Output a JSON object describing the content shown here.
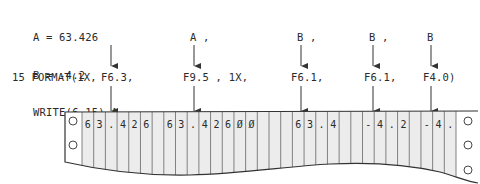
{
  "code": {
    "line1": "A = 63.426",
    "line2": "B = -4.2",
    "line3": "WRITE(6,15) A ,"
  },
  "variables": [
    {
      "label": "A ,",
      "x": 238
    },
    {
      "label": "A ,",
      "x": 299
    },
    {
      "label": "B ,",
      "x": 373
    },
    {
      "label": "B",
      "x": 430
    }
  ],
  "format": {
    "prefix": "15 FORMAT(1X,",
    "specs": [
      {
        "label": "F6.3,",
        "x": 101
      },
      {
        "label": "F9.5 , 1X,",
        "x": 183
      },
      {
        "label": "F6.1,",
        "x": 291
      },
      {
        "label": "F6.1,",
        "x": 364
      },
      {
        "label": "F4.0)",
        "x": 423
      }
    ]
  },
  "printout": {
    "cells": [
      "6",
      "3",
      ".",
      "4",
      "2",
      "6",
      " ",
      "6",
      "3",
      ".",
      "4",
      "2",
      "6",
      "0",
      "0",
      " ",
      " ",
      " ",
      "6",
      "3",
      ".",
      "4",
      " ",
      " ",
      "-",
      "4",
      ".",
      "2",
      " ",
      "-",
      "4",
      "."
    ],
    "output_line": "63.426 63.42600   63.4  -4.2 -4.",
    "paper_color": "#ececec",
    "line_color": "#555555"
  },
  "arrows": [
    {
      "from": "WRITE A (1)",
      "to": "F6.3",
      "x": 111
    },
    {
      "from": "A (2)",
      "to": "F9.5",
      "x": 194
    },
    {
      "from": "A (3)",
      "to": "F6.1",
      "x": 301
    },
    {
      "from": "B (1)",
      "to": "F6.1",
      "x": 373
    },
    {
      "from": "B (2)",
      "to": "F4.0",
      "x": 431
    }
  ]
}
